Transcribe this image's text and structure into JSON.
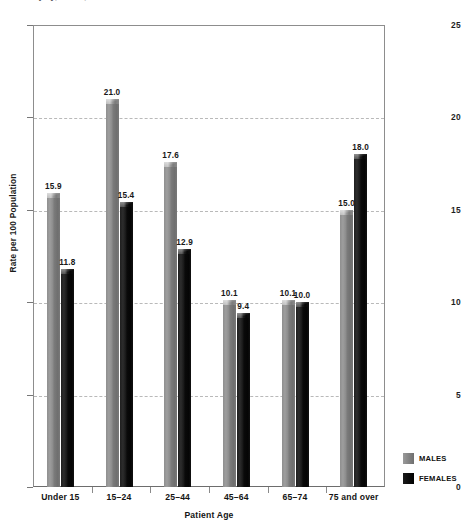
{
  "caption": {
    "text": "ions of injury, NEHS, rates vs chart 49 1"
  },
  "legend": {
    "position": "bottom-right",
    "entries": [
      {
        "label": "MALES",
        "color": "#8a8a8a",
        "swatch": "males"
      },
      {
        "label": "FEMALES",
        "color": "#000000",
        "swatch": "females"
      }
    ]
  },
  "chart_data": {
    "type": "bar",
    "title": "",
    "xlabel": "Patient Age",
    "ylabel": "Rate per 100 Population",
    "categories": [
      "Under 15",
      "15–24",
      "25–44",
      "45–64",
      "65–74",
      "75 and over"
    ],
    "series": [
      {
        "name": "MALES",
        "color": "#8a8a8a",
        "values": [
          15.9,
          21.0,
          17.6,
          10.1,
          10.1,
          15.0
        ]
      },
      {
        "name": "FEMALES",
        "color": "#000000",
        "values": [
          11.8,
          15.4,
          12.9,
          9.4,
          10.0,
          18.0
        ]
      }
    ],
    "value_labels": [
      [
        "15.9",
        "21.0",
        "17.6",
        "10.1",
        "10.1",
        "15.0"
      ],
      [
        "11.8",
        "15.4",
        "12.9",
        "9.4",
        "10.0",
        "18.0"
      ]
    ],
    "ylim": [
      0,
      25
    ],
    "yticks": [
      0,
      5,
      10,
      15,
      20,
      25
    ],
    "ytick_labels": [
      "0",
      "5",
      "10",
      "15",
      "20",
      "25"
    ],
    "grid": "horizontal-dashed",
    "legend_position": "bottom-right"
  }
}
